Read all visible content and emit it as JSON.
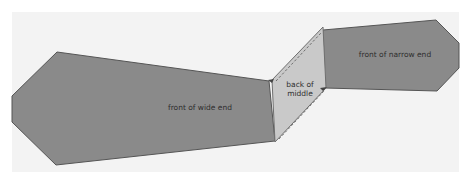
{
  "diagram": {
    "background_color": "#f3f3f3",
    "pieces": [
      {
        "id": "wide-end",
        "label": "front of wide end",
        "fill": "#8a8a8a",
        "stroke": "#555555"
      },
      {
        "id": "middle",
        "label_line1": "back of",
        "label_line2": "middle",
        "fill": "#c9c9c9",
        "stroke": "#6f6f6f",
        "stitch_color": "#555555"
      },
      {
        "id": "narrow-end",
        "label": "front of narrow end",
        "fill": "#8a8a8a",
        "stroke": "#555555"
      }
    ]
  }
}
